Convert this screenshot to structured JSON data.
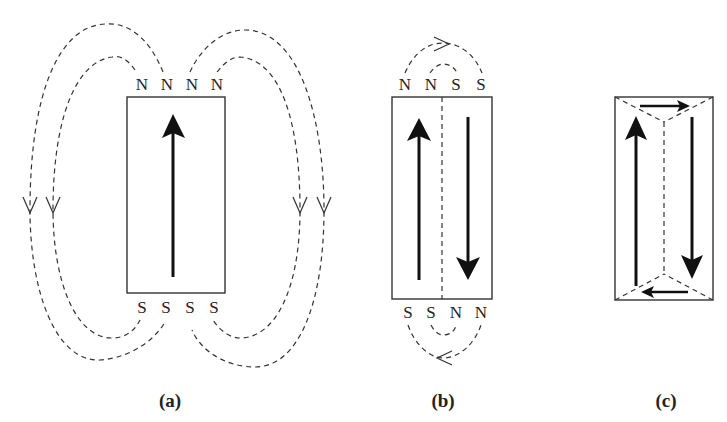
{
  "figure": {
    "panels": [
      {
        "id": "a",
        "caption": "(a)",
        "top_poles": [
          "N",
          "N",
          "N",
          "N"
        ],
        "bottom_poles": [
          "S",
          "S",
          "S",
          "S"
        ],
        "magnetization": "up",
        "description": "Single domain with external stray field loops"
      },
      {
        "id": "b",
        "caption": "(b)",
        "top_poles": [
          "N",
          "N",
          "S",
          "S"
        ],
        "bottom_poles": [
          "S",
          "S",
          "N",
          "N"
        ],
        "magnetization": [
          "up",
          "down"
        ],
        "description": "Two antiparallel domains with a domain wall"
      },
      {
        "id": "c",
        "caption": "(c)",
        "top_poles": [],
        "bottom_poles": [],
        "magnetization": [
          "up",
          "right",
          "down",
          "left"
        ],
        "description": "Closure domains, no external poles"
      }
    ]
  }
}
